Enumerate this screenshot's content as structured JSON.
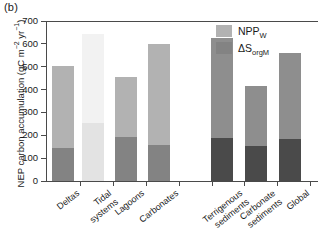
{
  "panel": {
    "label": "(b)"
  },
  "axes": {
    "ylabel_main": "NEP carbon accumulation (gC m",
    "ylabel_sup1": "−2",
    "ylabel_mid": " yr",
    "ylabel_sup2": "−1",
    "ylabel_end": ")",
    "ylabel_full": "NEP carbon accumulation (gC m−2 yr−1)",
    "yticks": [
      "0",
      "100",
      "200",
      "300",
      "400",
      "500",
      "600",
      "700"
    ],
    "ymin": 0,
    "ymax": 700,
    "xlabel": ""
  },
  "legend": {
    "position": "top-right",
    "entries": [
      {
        "name": "npp",
        "label_main": "NPP",
        "label_sub": "W",
        "color": "#b2b2b2"
      },
      {
        "name": "sorg",
        "label_main": "ΔS",
        "label_sub": "orgM",
        "color": "#838383"
      }
    ]
  },
  "chart_data": {
    "type": "bar",
    "title": "",
    "subtitle": "",
    "xlabel": "",
    "ylabel": "NEP carbon accumulation (gC m−2 yr−1)",
    "ylim": [
      0,
      700
    ],
    "ytick_step": 100,
    "grid": false,
    "stacked": true,
    "legend_position": "top-right",
    "categories": [
      "Deltas",
      "Tidal systems",
      "Lagoons",
      "Carbonates",
      "Terrigenous sediments",
      "Carbonate sediments",
      "Global"
    ],
    "series": [
      {
        "name": "ΔS_orgM",
        "label": "ΔSorgM",
        "color": "#838383",
        "values": [
          145,
          255,
          192,
          157,
          190,
          153,
          182
        ]
      },
      {
        "name": "NPP_W",
        "label": "NPPW",
        "color": "#b2b2b2",
        "values": [
          360,
          390,
          263,
          443,
          435,
          262,
          380
        ]
      }
    ],
    "totals": [
      505,
      645,
      455,
      600,
      625,
      415,
      562
    ],
    "groups": [
      {
        "name": "habitats",
        "categories": [
          "Deltas",
          "Tidal systems",
          "Lagoons",
          "Carbonates"
        ]
      },
      {
        "name": "shelf-sediments",
        "categories": [
          "Terrigenous sediments",
          "Carbonate sediments",
          "Global"
        ]
      }
    ],
    "notes": [
      "Tidal systems bar is rendered washed-out/faded in the source scan",
      "Right-hand group bars are rendered in darker greys than the left group"
    ]
  },
  "xlabels": [
    {
      "name": "deltas",
      "lines": [
        "Deltas"
      ]
    },
    {
      "name": "tidal-systems",
      "lines": [
        "Tidal",
        "systems"
      ]
    },
    {
      "name": "lagoons",
      "lines": [
        "Lagoons"
      ]
    },
    {
      "name": "carbonates",
      "lines": [
        "Carbonates"
      ]
    },
    {
      "name": "terrigenous-sediments",
      "lines": [
        "Terrigenous",
        "sediments"
      ]
    },
    {
      "name": "carbonate-sediments",
      "lines": [
        "Carbonate",
        "sediments"
      ]
    },
    {
      "name": "global",
      "lines": [
        "Global"
      ]
    }
  ]
}
